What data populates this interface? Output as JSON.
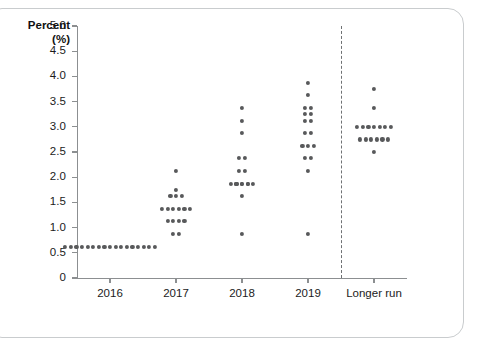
{
  "chart_data": {
    "type": "scatter",
    "title": "",
    "subtitle": "",
    "xlabel": "",
    "ylabel": "Percent (%)",
    "ylabel_line1": "Percent",
    "ylabel_line2": "(%)",
    "ylim": [
      0,
      5.0
    ],
    "ytick_labels": [
      "5.0",
      "4.5",
      "4.0",
      "3.5",
      "3.0",
      "2.5",
      "2.0",
      "1.5",
      "1.0",
      "0.5",
      "0"
    ],
    "ytick_values": [
      5.0,
      4.5,
      4.0,
      3.5,
      3.0,
      2.5,
      2.0,
      1.5,
      1.0,
      0.5,
      0
    ],
    "categories": [
      "2016",
      "2017",
      "2018",
      "2019",
      "Longer run"
    ],
    "grid": false,
    "legend": false,
    "divider_after_category": "2019",
    "dot_color": "#58595b",
    "axis_color": "#8c8f91",
    "series": [
      {
        "name": "2016",
        "category": "2016",
        "levels": [
          {
            "value": 0.625,
            "count": 17
          }
        ]
      },
      {
        "name": "2017",
        "category": "2017",
        "levels": [
          {
            "value": 2.125,
            "count": 1
          },
          {
            "value": 1.75,
            "count": 1
          },
          {
            "value": 1.625,
            "count": 3
          },
          {
            "value": 1.375,
            "count": 6
          },
          {
            "value": 1.125,
            "count": 4
          },
          {
            "value": 0.875,
            "count": 2
          }
        ]
      },
      {
        "name": "2018",
        "category": "2018",
        "levels": [
          {
            "value": 3.375,
            "count": 1
          },
          {
            "value": 3.125,
            "count": 1
          },
          {
            "value": 2.875,
            "count": 1
          },
          {
            "value": 2.375,
            "count": 2
          },
          {
            "value": 2.125,
            "count": 2
          },
          {
            "value": 1.875,
            "count": 3
          },
          {
            "value": 1.875,
            "count": 5
          },
          {
            "value": 1.625,
            "count": 1
          },
          {
            "value": 0.875,
            "count": 1
          }
        ]
      },
      {
        "name": "2019",
        "category": "2019",
        "levels": [
          {
            "value": 3.875,
            "count": 1
          },
          {
            "value": 3.625,
            "count": 1
          },
          {
            "value": 3.375,
            "count": 2
          },
          {
            "value": 3.25,
            "count": 2
          },
          {
            "value": 3.125,
            "count": 2
          },
          {
            "value": 2.875,
            "count": 2
          },
          {
            "value": 2.625,
            "count": 3
          },
          {
            "value": 2.375,
            "count": 2
          },
          {
            "value": 2.125,
            "count": 1
          },
          {
            "value": 0.875,
            "count": 1
          }
        ]
      },
      {
        "name": "Longer run",
        "category": "Longer run",
        "levels": [
          {
            "value": 3.75,
            "count": 1
          },
          {
            "value": 3.375,
            "count": 1
          },
          {
            "value": 3.0,
            "count": 7
          },
          {
            "value": 2.75,
            "count": 6
          },
          {
            "value": 2.5,
            "count": 1
          }
        ]
      }
    ]
  }
}
